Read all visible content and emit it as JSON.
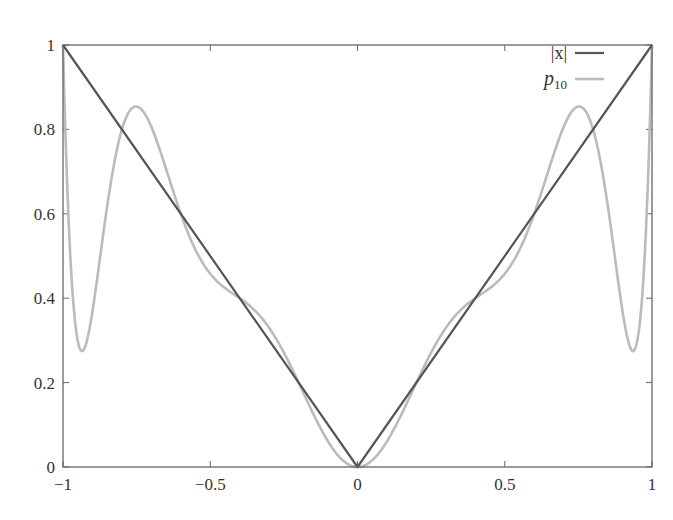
{
  "chart_data": {
    "type": "line",
    "title": "",
    "xlabel": "",
    "ylabel": "",
    "xlim": [
      -1,
      1
    ],
    "ylim": [
      0,
      1
    ],
    "grid": false,
    "legend_position": "upper right",
    "x_ticks": [
      -1,
      -0.5,
      0,
      0.5,
      1
    ],
    "x_tick_labels": [
      "−1",
      "−0.5",
      "0",
      "0.5",
      "1"
    ],
    "y_ticks": [
      0,
      0.2,
      0.4,
      0.6,
      0.8,
      1
    ],
    "y_tick_labels": [
      "0",
      "0.2",
      "0.4",
      "0.6",
      "0.8",
      "1"
    ],
    "interpolation_nodes": [
      -1,
      -0.8,
      -0.6,
      -0.4,
      -0.2,
      0,
      0.2,
      0.4,
      0.6,
      0.8,
      1
    ],
    "series": [
      {
        "name": "|x|",
        "legend_main": "|x|",
        "legend_sub": "",
        "color": "#555555",
        "width": 2.2,
        "x": [
          -1,
          0,
          1
        ],
        "y": [
          1,
          0,
          1
        ]
      },
      {
        "name": "p10",
        "legend_main": "p",
        "legend_sub": "10",
        "color": "#bbbbbb",
        "width": 2.6,
        "x": [
          -1,
          -0.98,
          -0.95,
          -0.9,
          -0.85,
          -0.8,
          -0.75,
          -0.7,
          -0.6,
          -0.5,
          -0.4,
          -0.3,
          -0.2,
          -0.1,
          0,
          0.1,
          0.2,
          0.3,
          0.4,
          0.5,
          0.6,
          0.7,
          0.75,
          0.8,
          0.85,
          0.9,
          0.95,
          0.98,
          1
        ],
        "y": [
          1,
          0.52,
          0.28,
          0.39,
          0.66,
          0.8,
          0.86,
          0.84,
          0.6,
          0.45,
          0.4,
          0.33,
          0.2,
          0.06,
          0,
          0.06,
          0.2,
          0.33,
          0.4,
          0.45,
          0.6,
          0.84,
          0.86,
          0.8,
          0.66,
          0.39,
          0.28,
          0.52,
          1
        ]
      }
    ]
  },
  "plot_area": {
    "left": 63,
    "top": 45,
    "right": 652,
    "bottom": 467
  },
  "colors": {
    "frame": "#666666",
    "text": "#333333"
  }
}
